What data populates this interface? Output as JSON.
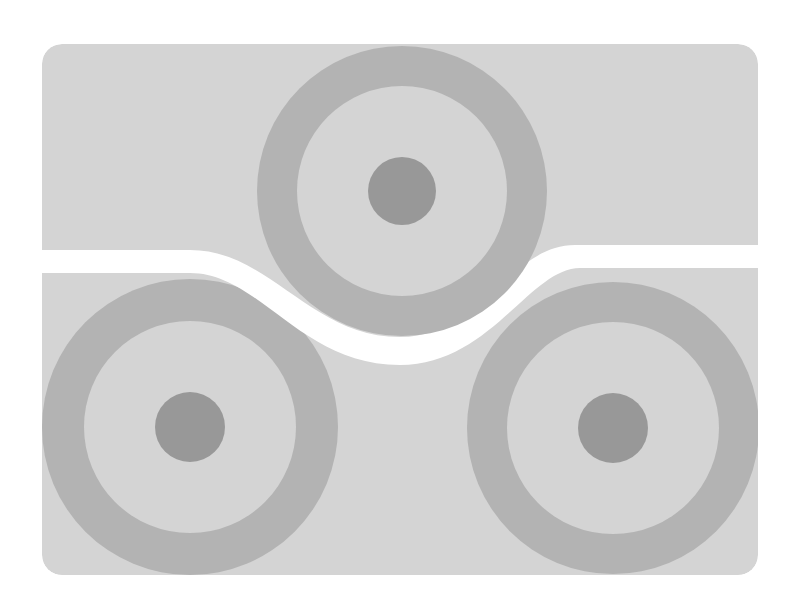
{
  "canvas": {
    "width": 799,
    "height": 611,
    "background": "#ffffff"
  },
  "card": {
    "x": 42,
    "y": 44,
    "width": 716,
    "height": 531,
    "radius": 20,
    "fill": "#d4d4d4"
  },
  "colors": {
    "card": "#d4d4d4",
    "ring": "#b3b3b3",
    "dot": "#989898",
    "inner": "#d4d4d4",
    "band": "#ffffff"
  },
  "targets": [
    {
      "name": "target-top",
      "cx": 402,
      "cy": 191,
      "outer_r": 145,
      "inner_r": 105,
      "dot_r": 34
    },
    {
      "name": "target-bottom-left",
      "cx": 190,
      "cy": 427,
      "outer_r": 148,
      "inner_r": 106,
      "dot_r": 35
    },
    {
      "name": "target-bottom-right",
      "cx": 613,
      "cy": 428,
      "outer_r": 146,
      "inner_r": 106,
      "dot_r": 35
    }
  ],
  "band": {
    "fill": "#ffffff",
    "path": "M 30 250 L 190 250 C 270 250, 310 337, 400 337 C 480 337, 510 245, 575 245 L 775 245 L 775 268 L 580 268 C 530 268, 490 365, 400 365 C 300 365, 260 273, 190 273 L 30 273 Z"
  }
}
